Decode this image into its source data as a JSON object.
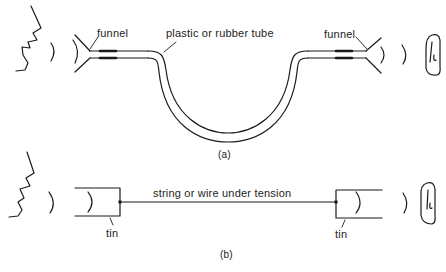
{
  "figure": {
    "panel_a": {
      "caption": "(a)",
      "labels": {
        "left_funnel": "funnel",
        "tube": "plastic or rubber tube",
        "right_funnel": "funnel"
      }
    },
    "panel_b": {
      "caption": "(b)",
      "labels": {
        "string": "string or wire under tension",
        "left_tin": "tin",
        "right_tin": "tin"
      }
    }
  }
}
